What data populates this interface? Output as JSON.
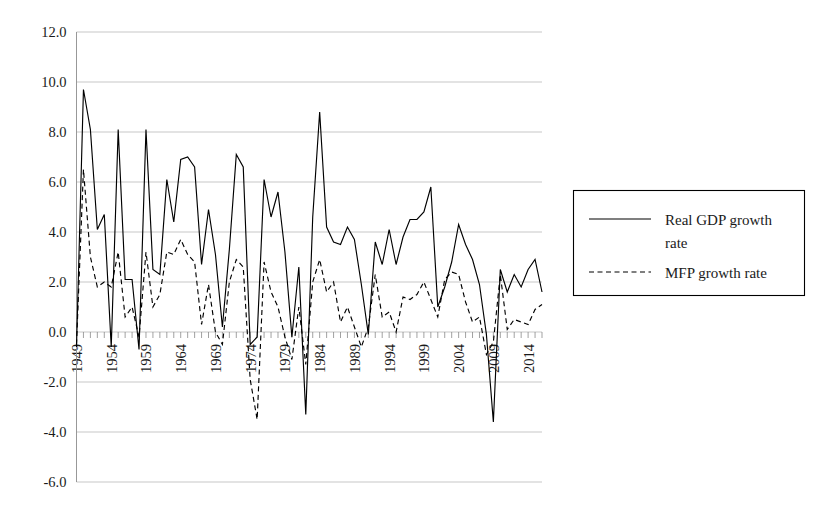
{
  "chart_data": {
    "type": "line",
    "title": "",
    "xlabel": "",
    "ylabel": "",
    "ylim": [
      -6.0,
      12.0
    ],
    "ytick_step": 2.0,
    "ytick_labels": [
      "12.0",
      "10.0",
      "8.0",
      "6.0",
      "4.0",
      "2.0",
      "0.0",
      "-2.0",
      "-4.0",
      "-6.0"
    ],
    "ytick_values": [
      12.0,
      10.0,
      8.0,
      6.0,
      4.0,
      2.0,
      0.0,
      -2.0,
      -4.0,
      -6.0
    ],
    "grid": true,
    "legend_position": "right",
    "x_start": 1949,
    "x_end": 2016,
    "xtick_labels": [
      "1949",
      "1954",
      "1959",
      "1964",
      "1969",
      "1974",
      "1979",
      "1984",
      "1989",
      "1994",
      "1999",
      "2004",
      "2009",
      "2014"
    ],
    "xtick_values": [
      1949,
      1954,
      1959,
      1964,
      1969,
      1974,
      1979,
      1984,
      1989,
      1994,
      1999,
      2004,
      2009,
      2014
    ],
    "x": [
      1949,
      1950,
      1951,
      1952,
      1953,
      1954,
      1955,
      1956,
      1957,
      1958,
      1959,
      1960,
      1961,
      1962,
      1963,
      1964,
      1965,
      1966,
      1967,
      1968,
      1969,
      1970,
      1971,
      1972,
      1973,
      1974,
      1975,
      1976,
      1977,
      1978,
      1979,
      1980,
      1981,
      1982,
      1983,
      1984,
      1985,
      1986,
      1987,
      1988,
      1989,
      1990,
      1991,
      1992,
      1993,
      1994,
      1995,
      1996,
      1997,
      1998,
      1999,
      2000,
      2001,
      2002,
      2003,
      2004,
      2005,
      2006,
      2007,
      2008,
      2009,
      2010,
      2011,
      2012,
      2013,
      2014,
      2015,
      2016
    ],
    "series": [
      {
        "name": "Real GDP growth rate",
        "style": "solid",
        "color": "#000000",
        "values": [
          -0.6,
          9.7,
          8.1,
          4.1,
          4.7,
          -0.6,
          8.1,
          2.1,
          2.1,
          -0.7,
          8.1,
          2.5,
          2.3,
          6.1,
          4.4,
          6.9,
          7.0,
          6.6,
          2.7,
          4.9,
          3.1,
          0.2,
          3.3,
          7.1,
          6.6,
          -0.5,
          -0.2,
          6.1,
          4.6,
          5.6,
          3.2,
          -0.2,
          2.6,
          -3.3,
          4.6,
          8.8,
          4.2,
          3.6,
          3.5,
          4.2,
          3.7,
          1.9,
          -0.1,
          3.6,
          2.7,
          4.1,
          2.7,
          3.8,
          4.5,
          4.5,
          4.8,
          5.8,
          1.0,
          1.8,
          2.8,
          4.3,
          3.5,
          2.9,
          1.9,
          -0.1,
          -3.6,
          2.5,
          1.6,
          2.3,
          1.8,
          2.5,
          2.9,
          1.6
        ]
      },
      {
        "name": "MFP growth rate",
        "style": "dashed",
        "color": "#000000",
        "values": [
          -0.5,
          6.5,
          3.0,
          1.8,
          2.0,
          1.8,
          3.2,
          0.6,
          1.0,
          -0.2,
          3.2,
          1.0,
          1.5,
          3.2,
          3.1,
          3.7,
          3.1,
          2.8,
          0.3,
          1.9,
          0.0,
          -0.5,
          2.0,
          2.9,
          2.6,
          -1.9,
          -3.5,
          2.8,
          1.6,
          1.0,
          -0.2,
          -1.1,
          1.0,
          -1.3,
          2.0,
          2.9,
          1.6,
          2.0,
          0.4,
          1.0,
          0.2,
          -0.6,
          0.2,
          2.3,
          0.6,
          0.8,
          0.0,
          1.4,
          1.3,
          1.5,
          2.0,
          1.3,
          0.6,
          2.1,
          2.4,
          2.3,
          1.2,
          0.4,
          0.6,
          -0.9,
          -0.4,
          2.3,
          0.1,
          0.5,
          0.4,
          0.3,
          0.9,
          1.1
        ]
      }
    ]
  },
  "legend": {
    "entries": [
      {
        "label": "Real GDP growth rate",
        "style": "solid"
      },
      {
        "label": "MFP growth rate",
        "style": "dashed"
      }
    ],
    "line1_text": "Real GDP growth",
    "line2_text": "rate",
    "mfp_text": "MFP growth rate"
  }
}
